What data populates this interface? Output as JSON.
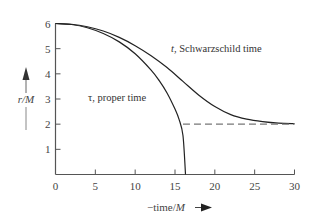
{
  "chart_data": {
    "type": "line",
    "title": "",
    "xlabel": "−time/M",
    "ylabel": "r/M",
    "xlim": [
      0,
      30
    ],
    "ylim": [
      0,
      6
    ],
    "xticks": [
      0,
      5,
      10,
      15,
      20,
      25,
      30
    ],
    "yticks": [
      1,
      2,
      3,
      4,
      5,
      6
    ],
    "grid": false,
    "legend": "none (inline curve annotations)",
    "series": [
      {
        "name": "τ, proper time",
        "style": "solid",
        "x": [
          0,
          2,
          4,
          6,
          8,
          10,
          12,
          13,
          14,
          15,
          15.5,
          16,
          16.32
        ],
        "y": [
          6.0,
          5.96,
          5.83,
          5.6,
          5.27,
          4.8,
          4.15,
          3.74,
          3.24,
          2.6,
          2.2,
          1.55,
          0.0
        ]
      },
      {
        "name": "t, Schwarzschild time",
        "style": "solid",
        "x": [
          0,
          2,
          4,
          6,
          8,
          10,
          12,
          14,
          16,
          18,
          20,
          22,
          24,
          26,
          28,
          30
        ],
        "y": [
          6.0,
          5.97,
          5.87,
          5.7,
          5.45,
          5.12,
          4.72,
          4.25,
          3.7,
          3.15,
          2.7,
          2.38,
          2.2,
          2.1,
          2.04,
          2.02
        ]
      },
      {
        "name": "r = 2M horizon asymptote",
        "style": "dashed",
        "x": [
          16,
          30
        ],
        "y": [
          2,
          2
        ]
      }
    ],
    "annotations": [
      {
        "text_symbol": "t",
        "text": ", Schwarzschild time",
        "x": 14.5,
        "y": 4.95
      },
      {
        "text_symbol": "τ",
        "text": ", proper time",
        "x": 3.8,
        "y": 3.1
      }
    ]
  },
  "labels": {
    "y_axis_symbol": "r/M",
    "x_axis_prefix": "−time/",
    "x_axis_symbol": "M",
    "schwarzschild_symbol": "t",
    "schwarzschild_text": ", Schwarzschild time",
    "proper_symbol": "τ",
    "proper_text": ", proper time"
  },
  "colors": {
    "axis": "#555555",
    "curve": "#222222",
    "dashed": "#777777",
    "text": "#444444"
  }
}
